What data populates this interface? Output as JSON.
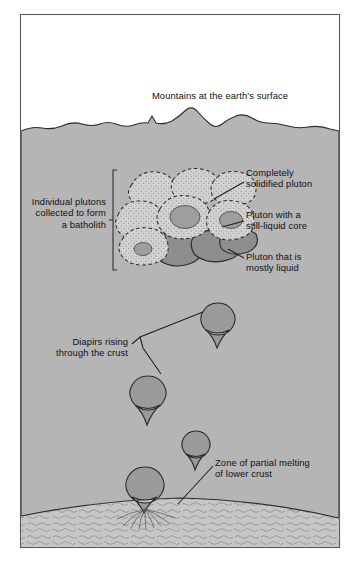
{
  "figure": {
    "type": "geological-cross-section",
    "title_caption": "Mountains at the earth's surface",
    "frame": {
      "x": 20,
      "y": 14,
      "width": 320,
      "height": 534,
      "border_color": "#4a4a4a",
      "background": "#ffffff"
    },
    "colors": {
      "sky": "#ffffff",
      "crust": "#b5b5b5",
      "partial_melt_zone": "#c4c4c4",
      "solidified_pluton": "#d2d2d2",
      "liquid_core": "#9e9e9e",
      "mostly_liquid_pluton": "#8e8e8e",
      "diapir": "#9a9a9a",
      "outline": "#2b2b2b",
      "text": "#111111"
    },
    "labels": [
      {
        "id": "mountains",
        "text": "Mountains at the earth's surface",
        "x": 122,
        "y": 90,
        "align": "center",
        "leader": false
      },
      {
        "id": "batholith",
        "text": "Individual plutons\ncollected to form\na batholith",
        "x": 22,
        "y": 196,
        "align": "right",
        "leader": true
      },
      {
        "id": "solidified",
        "text": "Completely\nsolidified pluton",
        "x": 246,
        "y": 167,
        "align": "left",
        "leader": true
      },
      {
        "id": "liquid-core",
        "text": "Pluton with a\nstill-liquid core",
        "x": 246,
        "y": 209,
        "align": "left",
        "leader": true
      },
      {
        "id": "mostly-liquid",
        "text": "Pluton that is\nmostly liquid",
        "x": 246,
        "y": 251,
        "align": "left",
        "leader": true
      },
      {
        "id": "diapirs",
        "text": "Diapirs rising\nthrough the crust",
        "x": 48,
        "y": 336,
        "align": "right",
        "leader": true
      },
      {
        "id": "melt-zone",
        "text": "Zone of partial melting\nof lower crust",
        "x": 215,
        "y": 457,
        "align": "left",
        "leader": true
      }
    ],
    "features": {
      "surface_line_y": 122,
      "melt_zone_top_y": 505,
      "plutons_solid_count": 6,
      "plutons_with_core_count": 3,
      "plutons_mostly_liquid_count": 3,
      "diapirs": [
        {
          "id": "diapir-1",
          "cx": 218,
          "cy": 320,
          "r": 17
        },
        {
          "id": "diapir-2",
          "cx": 148,
          "cy": 394,
          "r": 18
        },
        {
          "id": "diapir-3",
          "cx": 196,
          "cy": 445,
          "r": 14
        },
        {
          "id": "diapir-4",
          "cx": 145,
          "cy": 486,
          "r": 19,
          "rooted": true
        }
      ]
    }
  }
}
